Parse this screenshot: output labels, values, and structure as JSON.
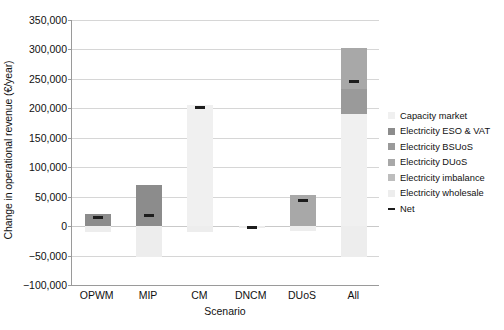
{
  "chart_data": {
    "type": "bar",
    "stacked": true,
    "title": "",
    "xlabel": "Scenario",
    "ylabel": "Change in operational revenue (€/year)",
    "categories": [
      "OPWM",
      "MIP",
      "CM",
      "DNCM",
      "DUoS",
      "All"
    ],
    "ylim": [
      -100000,
      350000
    ],
    "ytick_values": [
      350000,
      300000,
      250000,
      200000,
      150000,
      100000,
      50000,
      0,
      -50000,
      -100000
    ],
    "ytick_labels": [
      "350,000",
      "300,000",
      "250,000",
      "200,000",
      "150,000",
      "100,000",
      "50,000",
      "0",
      "−50,000",
      "−100,000"
    ],
    "grid": true,
    "legend_position": "right",
    "series": [
      {
        "name": "Capacity market",
        "color": "#f0f0f0",
        "values": [
          0,
          0,
          205000,
          0,
          0,
          190000
        ]
      },
      {
        "name": "Electricity ESO & VAT",
        "color": "#8c8c8c",
        "values": [
          20000,
          70000,
          0,
          0,
          0,
          0
        ]
      },
      {
        "name": "Electricity BSUoS",
        "color": "#9a9a9a",
        "values": [
          0,
          0,
          0,
          0,
          0,
          43000
        ]
      },
      {
        "name": "Electricity DUoS",
        "color": "#a8a8a8",
        "values": [
          0,
          0,
          0,
          0,
          52000,
          70000
        ]
      },
      {
        "name": "Electricity imbalance",
        "color": "#bdbdbd",
        "values": [
          0,
          0,
          0,
          0,
          0,
          0
        ]
      },
      {
        "name": "Electricity wholesale",
        "color": "#ededed",
        "values": [
          -10000,
          -53000,
          -10000,
          -2500,
          -9000,
          -52000
        ]
      }
    ],
    "net": {
      "name": "Net",
      "color": "#1d1d1d",
      "values": [
        14000,
        18000,
        202000,
        -2500,
        44000,
        245000
      ]
    }
  }
}
